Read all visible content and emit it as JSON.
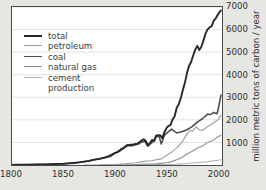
{
  "figure": {
    "background_color": "#e6e6e2",
    "plot_background_color": "#ffffff",
    "frame_color": "#4a4a4a",
    "grid_color": "#d5d5d5"
  },
  "axis": {
    "y_title": "million metric tons of carbon / year",
    "x_ticks": [
      "1800",
      "1850",
      "1900",
      "1950",
      "2000"
    ],
    "y_ticks": [
      "1000",
      "2000",
      "3000",
      "4000",
      "5000",
      "6000",
      "7000"
    ]
  },
  "legend": {
    "items": [
      {
        "label": "total",
        "color": "#262626",
        "width": 1.9
      },
      {
        "label": "petroleum",
        "color": "#9a9a9a",
        "width": 1.1
      },
      {
        "label": "coal",
        "color": "#4f4f4f",
        "width": 1.6
      },
      {
        "label": "natural gas",
        "color": "#8f8f8f",
        "width": 1.1
      },
      {
        "label": "cement",
        "color": "#b4b4b4",
        "width": 1.1
      }
    ],
    "continuation_label": "production"
  },
  "chart_data": {
    "type": "line",
    "title": "",
    "xlabel": "",
    "ylabel": "million metric tons of carbon / year",
    "xlim": [
      1800,
      2004
    ],
    "ylim": [
      0,
      7000
    ],
    "grid": true,
    "legend_position": "upper left",
    "x_ticks": [
      1800,
      1850,
      1900,
      1950,
      2000
    ],
    "y_ticks": [
      1000,
      2000,
      3000,
      4000,
      5000,
      6000,
      7000
    ],
    "series": [
      {
        "name": "total",
        "color": "#262626",
        "width": 1.9,
        "x": [
          1800,
          1805,
          1810,
          1815,
          1820,
          1825,
          1830,
          1835,
          1840,
          1845,
          1850,
          1855,
          1860,
          1865,
          1870,
          1875,
          1880,
          1885,
          1890,
          1895,
          1900,
          1902,
          1904,
          1906,
          1908,
          1910,
          1912,
          1914,
          1916,
          1918,
          1920,
          1922,
          1924,
          1926,
          1928,
          1930,
          1932,
          1934,
          1936,
          1938,
          1940,
          1942,
          1944,
          1946,
          1948,
          1950,
          1952,
          1954,
          1956,
          1958,
          1960,
          1962,
          1964,
          1966,
          1968,
          1970,
          1972,
          1974,
          1976,
          1978,
          1980,
          1982,
          1984,
          1986,
          1988,
          1990,
          1992,
          1994,
          1996,
          1998,
          2000,
          2002,
          2003
        ],
        "y": [
          8,
          9,
          11,
          13,
          17,
          21,
          25,
          30,
          38,
          49,
          54,
          71,
          91,
          114,
          147,
          182,
          236,
          271,
          325,
          382,
          534,
          563,
          626,
          705,
          743,
          819,
          892,
          890,
          901,
          906,
          932,
          950,
          1015,
          1090,
          1139,
          1053,
          880,
          970,
          1110,
          1070,
          1300,
          1320,
          1320,
          1190,
          1450,
          1630,
          1730,
          1770,
          2020,
          2160,
          2540,
          2690,
          2970,
          3320,
          3650,
          4080,
          4400,
          4560,
          4850,
          5110,
          5280,
          5090,
          5250,
          5520,
          5820,
          6010,
          6100,
          6150,
          6400,
          6500,
          6670,
          6800,
          6850
        ]
      },
      {
        "name": "coal",
        "color": "#4f4f4f",
        "width": 1.6,
        "x": [
          1800,
          1810,
          1820,
          1830,
          1840,
          1850,
          1860,
          1870,
          1880,
          1890,
          1900,
          1905,
          1910,
          1913,
          1915,
          1918,
          1920,
          1923,
          1925,
          1929,
          1932,
          1935,
          1938,
          1940,
          1943,
          1945,
          1948,
          1950,
          1955,
          1960,
          1965,
          1970,
          1975,
          1980,
          1985,
          1990,
          1993,
          1996,
          1999,
          2000,
          2003
        ],
        "y": [
          8,
          11,
          17,
          25,
          38,
          54,
          91,
          147,
          236,
          325,
          534,
          623,
          790,
          860,
          840,
          870,
          900,
          930,
          1000,
          1050,
          830,
          960,
          1060,
          1250,
          1270,
          930,
          1310,
          1400,
          1590,
          1420,
          1470,
          1560,
          1700,
          1900,
          2050,
          2250,
          2240,
          2330,
          2270,
          2400,
          3100
        ]
      },
      {
        "name": "petroleum",
        "color": "#9a9a9a",
        "width": 1.1,
        "x": [
          1870,
          1880,
          1890,
          1900,
          1910,
          1920,
          1930,
          1935,
          1940,
          1945,
          1950,
          1955,
          1960,
          1965,
          1970,
          1973,
          1975,
          1979,
          1982,
          1985,
          1990,
          1995,
          2000,
          2003
        ],
        "y": [
          1,
          3,
          10,
          24,
          53,
          97,
          170,
          190,
          230,
          270,
          420,
          570,
          760,
          1000,
          1380,
          1540,
          1490,
          1690,
          1560,
          1530,
          1700,
          1840,
          2000,
          2200
        ]
      },
      {
        "name": "natural gas",
        "color": "#8f8f8f",
        "width": 1.1,
        "x": [
          1885,
          1900,
          1910,
          1920,
          1930,
          1940,
          1950,
          1955,
          1960,
          1965,
          1970,
          1975,
          1980,
          1985,
          1990,
          1995,
          2000,
          2003
        ],
        "y": [
          1,
          4,
          9,
          16,
          37,
          50,
          97,
          150,
          230,
          330,
          490,
          610,
          740,
          840,
          1000,
          1090,
          1250,
          1320
        ]
      },
      {
        "name": "cement production",
        "color": "#b4b4b4",
        "width": 1.1,
        "x": [
          1930,
          1940,
          1950,
          1960,
          1970,
          1980,
          1990,
          2000,
          2003
        ],
        "y": [
          10,
          15,
          20,
          40,
          70,
          110,
          150,
          210,
          230
        ]
      }
    ]
  }
}
